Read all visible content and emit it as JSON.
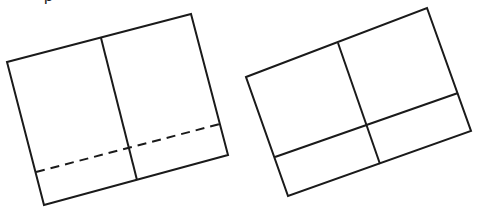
{
  "diagram": {
    "caption_clipped": "p",
    "stroke_color": "#1a1a1a",
    "figures": [
      {
        "name": "left-rectangle",
        "outline": "7,62 191,14 228,155 44,205",
        "divider_vertical": {
          "x1": 101,
          "y1": 38,
          "x2": 137,
          "y2": 180,
          "style": "solid"
        },
        "divider_horizontal": {
          "x1": 36,
          "y1": 172,
          "x2": 220,
          "y2": 124,
          "style": "dashed"
        }
      },
      {
        "name": "right-rectangle",
        "outline": "246,77 427,8 471,131 288,196",
        "divider_vertical": {
          "x1": 338,
          "y1": 43,
          "x2": 380,
          "y2": 164,
          "style": "solid"
        },
        "divider_horizontal": {
          "x1": 275,
          "y1": 157,
          "x2": 458,
          "y2": 93,
          "style": "solid"
        }
      }
    ]
  }
}
